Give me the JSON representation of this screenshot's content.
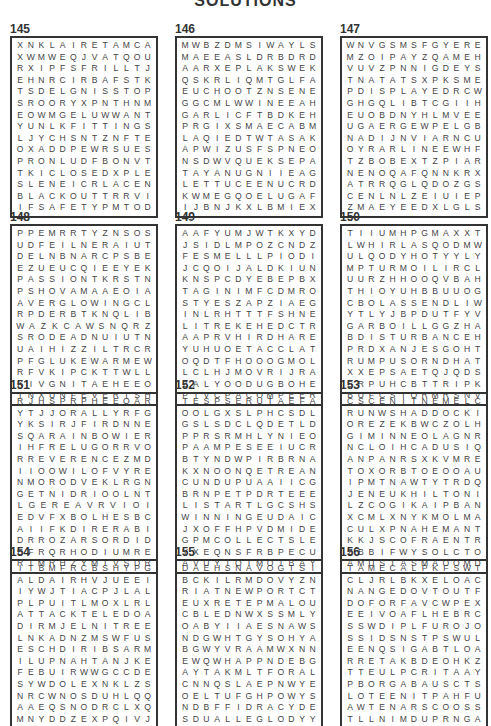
{
  "title": "SOLUTIONS",
  "puzzles": [
    {
      "number": "145",
      "rows": [
        "XNKLAIRETAMCA",
        "XWMWEQJVATQOU",
        "RXIPFSFRILLTJ",
        "EHNRCIRBAFSTK",
        "TSDELGNISSTOP",
        "SROORYXPNTHNM",
        "EOWMGELUWWANT",
        "YUNLKFITTINGS",
        "LJYCHSNTZNFTE",
        "OXADDPEWRSUES",
        "PRONLUDFBONVT",
        "TKICLOSEDXPLE",
        "SLENEICRLACEN",
        "BLACKOUTTRRVI",
        "IFSAFETYPMTOD"
      ]
    },
    {
      "number": "146",
      "rows": [
        "MWBZDMSIWAYLS",
        "MAEEASLDRBDRD",
        "AARXEPLAKSWEKR",
        "QSKRLIQMTGLFA",
        "EUCHOOTZNSENE",
        "GGCMLWWINEEAH",
        "GARLICFTBDKEH",
        "PRGIXSMAECABM",
        "LAQIEDTWTASAK",
        "APWIZUSFSPNEO",
        "NSDWVQUEKSEPA",
        "TAYANUGNIIEAG",
        "LETTUCEENUCRDG",
        "KWMEGQOELUGAF",
        "IJBNJKXLBMIEX"
      ]
    },
    {
      "number": "147",
      "rows": [
        "WNVGSMSFGYERE",
        "MZOIPAYZQAMEH",
        "VUVZPNNIGDEYS",
        "TNATATSXPKSME",
        "PDISPLAYEDRCW",
        "GHGQLIBTCGIIH",
        "EUOBDNYHLMVEE",
        "UGAERGEWPELGB",
        "NADIJNVIARNCU",
        "OYRARLINEEWHF",
        "TZBOBEXTZPIAR",
        "NENOQAFQNNKRX",
        "ATRRQGLQDOZGS",
        "CENLNLZEIUIEP",
        "ZMAEYEEDXLGLS"
      ]
    },
    {
      "number": "148",
      "rows": [
        "PPEMRRTYZNSOS",
        "UDFEILNERAIUT",
        "DELNBNARCPSBE",
        "EZUEUCQIEEYEK",
        "PASSIONTKRSTN",
        "PSHOVAMAAEOIA",
        "AVERGLOWINGCL",
        "RPDERBTKNQLIB",
        "WAZKCAWSNQRZ",
        "SRODEADNUIUTN",
        "UAIHIZZILTRCR",
        "PFGLUKEWARMEW",
        "RFVKIPCKTTWLL",
        "KIVGNITAEHEEO",
        "INXUNFEVERISH"
      ]
    },
    {
      "number": "149",
      "rows": [
        "AAFYUMJWTKXYD",
        "JSIDLMPOZCNDZ",
        "FESMELLLPIODI",
        "JCQOIJALDKIUN",
        "KNSPCDYEBEPBX",
        "TAGINIMFCDMRO",
        "STYESZAPZIAEG",
        "INLRHTTTFSHNE",
        "LITREKEHEDCTR",
        "AAPRVHIRDHARE",
        "YUHUOETACCLAT",
        "OQDTFHOOOGMOL",
        "LCLHJMOVRIJRA",
        "ZALYOODUGBOHE",
        "PIVCPACOMPEER"
      ]
    },
    {
      "number": "150",
      "rows": [
        "TIIUMHPGMAXXT",
        "LWHIRLASQODMW",
        "ULQODYHOTYYLY",
        "MPTURMOILIRCL",
        "UURZHHOOQVBAH",
        "THIOYUHBBUUOG",
        "CBOLASSENDLIW",
        "YTLYJBPDUTFYV",
        "GARBOILLGGZHA",
        "BDISTURBANCEH",
        "PRDXANJESGOHT",
        "RUMPUSORNDHAT",
        "XXEPSAETQJQDS",
        "SRPUHCBTTRIPK",
        "BUFCSTORMRSNV"
      ]
    },
    {
      "number": "151",
      "rows": [
        "RJHSPRPHEEQAR",
        "YTJJORALLYRFG",
        "YKSIRJFIRDNNE",
        "SQARAINBOWIER",
        "IHFRELUGORRVO",
        "RREVERENCEZMD",
        "IIOOWILOFVYRE",
        "NMORODVEKLRGN",
        "GETNIDRIOOLNT",
        "LGEREAVRVIOI",
        "EDVFXBOLHESBC",
        "AIIFKDIRERABI",
        "DRROZARSORDID",
        "EFRQRHODIUMRE",
        "RTMRHZYMIVSDR"
      ]
    },
    {
      "number": "152",
      "rows": [
        "TESPSERUTAEFA",
        "OOLGXSLPHCSDL",
        "GSLSDCLQDETLD",
        "PPRSRMHLYNIEO",
        "PAAMPESEEIUCR",
        "BTYNDWPIRBRNA",
        "KXNOONQETREAN",
        "CUNDUPUAAIICG",
        "BRNPETPDRTEEE",
        "LISTARTLGCSHS",
        "WINNINGEUDAIC",
        "JXOFFHPVDMIDE",
        "GPMCOLLECTSLE",
        "YXEQNSFRBPECU",
        "AVUYIOIMOIBAY"
      ]
    },
    {
      "number": "153",
      "rows": [
        "CSCENITNEMELC",
        "RUNWSHADDOCKI",
        "OREZEKBWCZOLH",
        "GIMINNEOLAGNR",
        "NCLOIHCADUSIQ",
        "ANPANRSXKVMRE",
        "TOXORBTOEOOAU",
        "IPMTNAWTYTRDQ",
        "JENEUKHILTONI",
        "LZCOGIKAIPBAN",
        "XCMLXNYKMOLMA",
        "CULXPNAHEMANT",
        "KKJSCOFRAENTR",
        "ZBBIFWYSOLCTO",
        "AMUSTASMAOOMD"
      ]
    },
    {
      "number": "154",
      "rows": [
        "ITBMFRCBSHYPG",
        "ALDAIRHVJUEEI",
        "IYWJTIACPJLAL",
        "PLPUITLMOXLRL",
        "ATTACKTELEDOASI",
        "DIRMJELNITREE",
        "LNKADNZMSWFUS",
        "ESCHDIRIBSARM",
        "ILUPNAHTANJKE",
        "FEBUIRWWGCCDE",
        "SYWDOLEXNKLZS",
        "NRCWNOSDUHLQQ",
        "AAEQSNODRCLXQ",
        "MNYDDZEXPQIVJ",
        "HOLEIFHCRURFR"
      ]
    },
    {
      "number": "155",
      "rows": [
        "DAEHSNAVOGTSI",
        "BCKILRMDOVYZN",
        "RIATNEWPORTCT",
        "EUXRETEPMALOU",
        "CBLEDNWXSSMLY",
        "OABYIIAESNAWS",
        "NDGWHTGYSOHYA",
        "BGWYVRAAMWXNN",
        "EWQWHAPPNDEBG",
        "AYTAKMLTFORAL",
        "CNNQSLAEPNWYE",
        "OELTUFGHPOWYS",
        "NDBFFIDRACYDE",
        "SDUALLEGLODYY",
        "DAEHSDIVADTSR"
      ]
    },
    {
      "number": "156",
      "rows": [
        "TAMECALPKFSWT",
        "CLJRLBKXELOAC",
        "NANGEDOVTOUTF",
        "DOFORFAVCWPEX",
        "EEIVOAFLHEBRC",
        "SSWDIPLFUROJO",
        "SSIDSNSTPSWUL",
        "EENQSIGABTLOA",
        "RRETAKBDEOHKZ",
        "TTEULPCRITAAY",
        "PBORGABAUSCTS",
        "LOTEENITPAHFU",
        "AWTENARSCOOSS",
        "TLLNIMDUPRNGA",
        "EVENWPHMKAZQN"
      ]
    }
  ]
}
